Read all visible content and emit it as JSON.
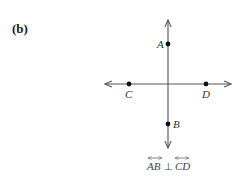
{
  "panel_label": "(b)",
  "points": {
    "A": {
      "label": "A",
      "x": 168,
      "y": 44
    },
    "B": {
      "label": "B",
      "x": 168,
      "y": 124
    },
    "C": {
      "label": "C",
      "x": 129,
      "y": 84
    },
    "D": {
      "label": "D",
      "x": 206,
      "y": 84
    }
  },
  "lines": [
    {
      "name": "AB",
      "orientation": "vertical"
    },
    {
      "name": "CD",
      "orientation": "horizontal"
    }
  ],
  "caption": {
    "left": "AB",
    "relation": "⊥",
    "right": "CD"
  },
  "colors": {
    "line": "#555555",
    "point": "#111111"
  }
}
